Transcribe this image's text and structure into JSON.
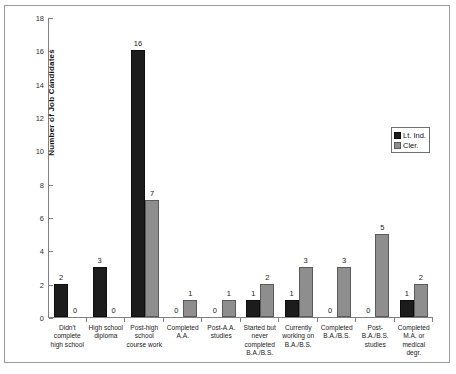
{
  "chart_data": {
    "type": "bar",
    "title": "",
    "xlabel": "",
    "ylabel": "Number of Job Candidates",
    "ylim": [
      0,
      18
    ],
    "yticks": [
      0,
      2,
      4,
      6,
      8,
      10,
      12,
      14,
      16,
      18
    ],
    "grid": false,
    "legend_position": "right",
    "categories": [
      "Didn't complete high school",
      "High school diploma",
      "Post-high school course work",
      "Completed A.A.",
      "Post-A.A. studies",
      "Started but never completed B.A./B.S.",
      "Currently working on B.A./B.S.",
      "Completed B.A./B.S.",
      "Post-B.A./B.S. studies",
      "Completed M.A. or medical degr."
    ],
    "category_lines": [
      [
        "Didn't",
        "complete",
        "high school"
      ],
      [
        "High school",
        "diploma"
      ],
      [
        "Post-high",
        "school",
        "course work"
      ],
      [
        "Completed",
        "A.A."
      ],
      [
        "Post-A.A.",
        "studies"
      ],
      [
        "Started but",
        "never",
        "completed",
        "B.A./B.S."
      ],
      [
        "Currently",
        "working on",
        "B.A./B.S."
      ],
      [
        "Completed",
        "B.A./B.S."
      ],
      [
        "Post-",
        "B.A./B.S.",
        "studies"
      ],
      [
        "Completed",
        "M.A. or",
        "medical degr."
      ]
    ],
    "series": [
      {
        "name": "Lt. Ind.",
        "color": "#1c1c1c",
        "values": [
          2,
          3,
          16,
          0,
          0,
          1,
          1,
          0,
          0,
          1
        ]
      },
      {
        "name": "Cler.",
        "color": "#8e8e8e",
        "values": [
          0,
          0,
          7,
          1,
          1,
          2,
          3,
          3,
          5,
          2
        ]
      }
    ]
  },
  "legend": {
    "items": [
      {
        "label": "Lt. Ind."
      },
      {
        "label": "Cler."
      }
    ]
  }
}
